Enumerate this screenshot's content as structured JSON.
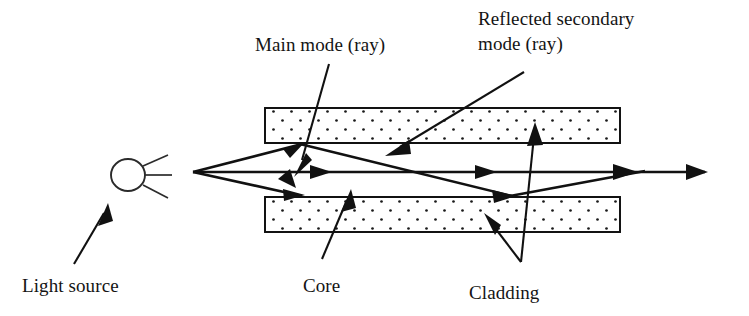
{
  "figure": {
    "background_color": "#ffffff",
    "ink_color": "#111111"
  },
  "labels": {
    "main_mode": "Main mode (ray)",
    "reflected_secondary_line1": "Reflected secondary",
    "reflected_secondary_line2": "mode (ray)",
    "light_source": "Light source",
    "core": "Core",
    "cladding": "Cladding"
  },
  "components": {
    "light_source_icon": "light-source-sun",
    "cladding_fill": "dotted-texture",
    "cladding_dot_color": "#1a1a1a",
    "cladding_dot_spacing_px": 9
  },
  "geometry": {
    "cladding_top": {
      "x": 265,
      "y": 108,
      "width": 355,
      "height": 35
    },
    "cladding_bottom": {
      "x": 265,
      "y": 197,
      "width": 355,
      "height": 35
    },
    "core_band": {
      "top_y": 143,
      "bottom_y": 197
    },
    "axis_y": 172,
    "source_center": {
      "x": 128,
      "y": 175,
      "radius": 17
    },
    "ray_origin": {
      "x": 193,
      "y": 172
    },
    "reflection_top": {
      "x": 300,
      "y": 143
    },
    "reflection_bottom": {
      "x": 510,
      "y": 197
    },
    "axis_end_x": 705
  },
  "rays": [
    {
      "name": "main-mode-axial-ray",
      "path": "origin to axis end, straight along fiber axis"
    },
    {
      "name": "upper-secondary-ray",
      "path": "origin up to top cladding boundary, reflects down-right"
    },
    {
      "name": "lower-secondary-ray",
      "path": "origin down to bottom cladding boundary, reflects up-right"
    },
    {
      "name": "reflected-secondary-ray",
      "path": "reflects off bottom boundary and rejoins axis downstream"
    }
  ]
}
